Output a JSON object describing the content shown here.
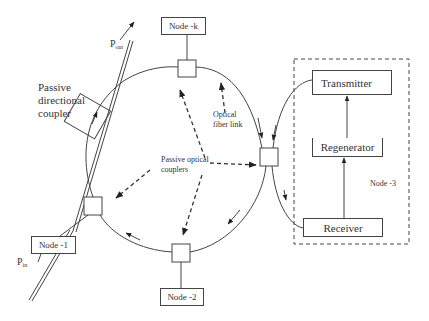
{
  "diagram": {
    "type": "ring optical network",
    "nodes": {
      "node_k": "Node -k",
      "node_1": "Node -1",
      "node_2": "Node -2",
      "node_3": "Node -3"
    },
    "node3_internals": {
      "transmitter": "Transmitter",
      "regenerator": "Regenerator",
      "receiver": "Receiver"
    },
    "labels": {
      "coupler_line1": "Passive",
      "coupler_line2": "directional",
      "coupler_line3": "coupler",
      "p_out_main": "P",
      "p_out_sub": "out",
      "p_in_main": "P",
      "p_in_sub": "in",
      "fiber_line1": "Optical",
      "fiber_line2": "fiber link",
      "poc_line1": "Passive optical",
      "poc_line2": "couplers"
    },
    "colors": {
      "stroke": "#444444",
      "text": "#333333",
      "background": "#ffffff"
    }
  }
}
